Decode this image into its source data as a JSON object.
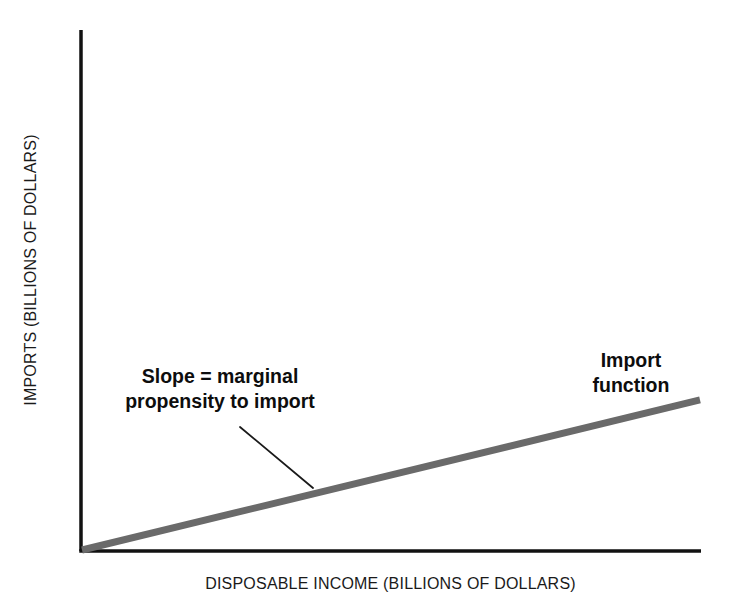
{
  "figure": {
    "background_color": "#ffffff",
    "axis_color": "#111111",
    "line_color": "#6a6a6a",
    "leader_color": "#1a1a1a",
    "text_color": "#0d0d0d"
  },
  "axes": {
    "y_title": "IMPORTS (BILLIONS OF DOLLARS)",
    "x_title": "DISPOSABLE INCOME (BILLIONS OF DOLLARS)"
  },
  "annotations": {
    "slope_line1": "Slope = marginal",
    "slope_line2": "propensity to import",
    "series_line1": "Import",
    "series_line2": "function"
  },
  "chart_data": {
    "type": "line",
    "title": "",
    "xlabel": "DISPOSABLE INCOME (BILLIONS OF DOLLARS)",
    "ylabel": "IMPORTS (BILLIONS OF DOLLARS)",
    "grid": false,
    "legend": "none",
    "xlim": [
      0,
      100
    ],
    "ylim": [
      0,
      100
    ],
    "xticks": [],
    "yticks": [],
    "series": [
      {
        "name": "Import function",
        "color": "#6a6a6a",
        "linewidth": 7,
        "x": [
          0,
          100
        ],
        "y": [
          0,
          29
        ]
      }
    ],
    "annotations": [
      {
        "name": "slope-callout",
        "text": "Slope = marginal propensity to import",
        "x": 20,
        "y": 43,
        "leader_to": [
          37,
          12.3
        ]
      },
      {
        "name": "series-callout",
        "text": "Import function",
        "x": 84,
        "y": 53
      }
    ]
  }
}
